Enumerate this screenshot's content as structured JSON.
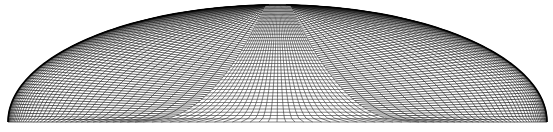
{
  "figure": {
    "colors": {
      "background": "#ffffff",
      "outer_mesh": "#1a1a1a",
      "inner_mesh": "#333333",
      "boundary": "#000000"
    },
    "domain": {
      "left_x": 8,
      "right_x": 547,
      "base_y": 122,
      "top_y": 5,
      "center_x": 277
    },
    "inner_region": {
      "top_left_x": 266,
      "top_right_x": 290,
      "bottom_left_x": 143,
      "bottom_right_x": 411,
      "vertical_lines": 30,
      "horizontal_lines": 36
    },
    "outer_region": {
      "radial_lines": 60,
      "arc_lines": 40
    }
  }
}
